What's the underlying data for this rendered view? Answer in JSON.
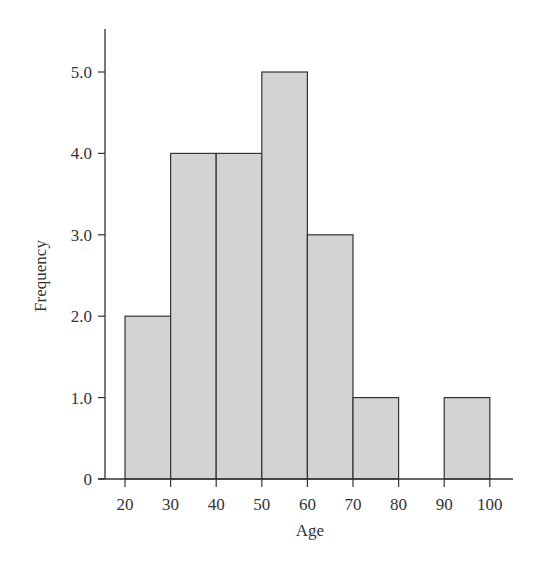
{
  "chart_data": {
    "type": "bar",
    "subtype": "histogram",
    "title": "",
    "xlabel": "Age",
    "ylabel": "Frequency",
    "bins": [
      {
        "start": 20,
        "end": 30,
        "value": 2
      },
      {
        "start": 30,
        "end": 40,
        "value": 4
      },
      {
        "start": 40,
        "end": 50,
        "value": 4
      },
      {
        "start": 50,
        "end": 60,
        "value": 5
      },
      {
        "start": 60,
        "end": 70,
        "value": 3
      },
      {
        "start": 70,
        "end": 80,
        "value": 1
      },
      {
        "start": 80,
        "end": 90,
        "value": 0
      },
      {
        "start": 90,
        "end": 100,
        "value": 1
      }
    ],
    "categories": [
      "20-30",
      "30-40",
      "40-50",
      "50-60",
      "60-70",
      "70-80",
      "80-90",
      "90-100"
    ],
    "values": [
      2,
      4,
      4,
      5,
      3,
      1,
      0,
      1
    ],
    "x_ticks": [
      "20",
      "30",
      "40",
      "50",
      "60",
      "70",
      "80",
      "90",
      "100"
    ],
    "y_ticks": [
      "0",
      "1.0",
      "2.0",
      "3.0",
      "4.0",
      "5.0"
    ],
    "xlim": [
      15.6,
      105
    ],
    "ylim": [
      0,
      5.5
    ],
    "grid": false,
    "legend": null,
    "bar_color": "#d3d3d3",
    "edge_color": "#333333"
  }
}
